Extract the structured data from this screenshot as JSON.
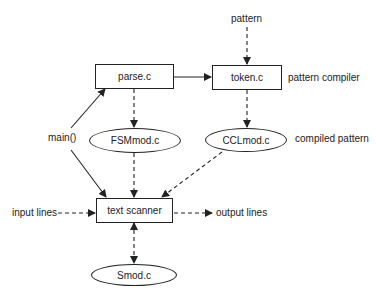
{
  "nodes": {
    "parse": "parse.c",
    "token": "token.c",
    "fsm": "FSMmod.c",
    "ccl": "CCLmod.c",
    "scanner": "text scanner",
    "smod": "Smod.c"
  },
  "labels": {
    "pattern": "pattern",
    "pattern_compiler": "pattern compiler",
    "compiled_pattern": "compiled pattern",
    "main": "main()",
    "input_lines": "input lines",
    "output_lines": "output lines"
  },
  "edges": [
    {
      "from": "pattern",
      "to": "token.c",
      "style": "dashed"
    },
    {
      "from": "parse.c",
      "to": "token.c",
      "style": "solid"
    },
    {
      "from": "main()",
      "to": "parse.c",
      "style": "solid"
    },
    {
      "from": "main()",
      "to": "text scanner",
      "style": "solid"
    },
    {
      "from": "parse.c",
      "to": "FSMmod.c",
      "style": "dashed"
    },
    {
      "from": "token.c",
      "to": "CCLmod.c",
      "style": "dashed"
    },
    {
      "from": "FSMmod.c",
      "to": "text scanner",
      "style": "dashed"
    },
    {
      "from": "CCLmod.c",
      "to": "text scanner",
      "style": "dashed"
    },
    {
      "from": "input lines",
      "to": "text scanner",
      "style": "dashed"
    },
    {
      "from": "text scanner",
      "to": "output lines",
      "style": "dashed"
    },
    {
      "from": "text scanner",
      "to": "Smod.c",
      "style": "dashed-bidirectional"
    }
  ]
}
